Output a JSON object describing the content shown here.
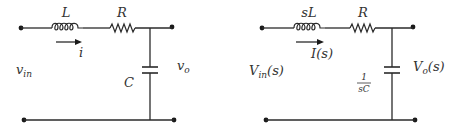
{
  "figure": {
    "left_circuit": {
      "title": "Time-domain RLC circuit",
      "inductor_label": "L",
      "resistor_label": "R",
      "capacitor_label": "C",
      "current_label": "i",
      "input_label_main": "v",
      "input_label_sub": "in",
      "output_label_main": "v",
      "output_label_sub": "o"
    },
    "right_circuit": {
      "title": "s-domain RLC circuit",
      "inductor_label": "sL",
      "resistor_label": "R",
      "capacitor_label_num": "1",
      "capacitor_label_den": "sC",
      "current_label": "I(s)",
      "input_label_main": "V",
      "input_label_sub": "in",
      "input_label_tail": "(s)",
      "output_label_main": "V",
      "output_label_sub": "o",
      "output_label_tail": "(s)"
    }
  }
}
